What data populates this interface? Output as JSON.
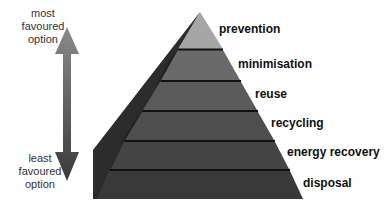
{
  "diagram": {
    "top_label": [
      "most",
      "favoured",
      "option"
    ],
    "bottom_label": [
      "least",
      "favoured",
      "option"
    ],
    "levels": [
      {
        "label": "prevention",
        "color": "#a6a6a6"
      },
      {
        "label": "minimisation",
        "color": "#6a6a6a"
      },
      {
        "label": "reuse",
        "color": "#5a5a5a"
      },
      {
        "label": "recycling",
        "color": "#4e4e4e"
      },
      {
        "label": "energy recovery",
        "color": "#444444"
      },
      {
        "label": "disposal",
        "color": "#393939"
      }
    ]
  }
}
